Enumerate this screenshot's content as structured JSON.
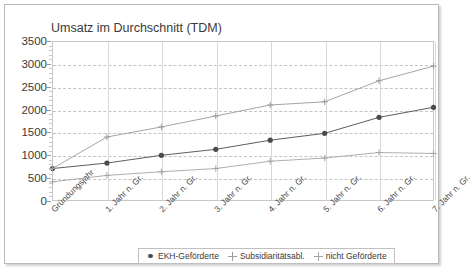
{
  "chart_data": {
    "type": "line",
    "title": "Umsatz im Durchschnitt (TDM)",
    "xlabel": "",
    "ylabel": "",
    "ylim": [
      0,
      3500
    ],
    "ytick_step": 500,
    "yticks": [
      "0",
      "500",
      "1000",
      "1500",
      "2000",
      "2500",
      "3000",
      "3500"
    ],
    "grid": true,
    "legend_position": "bottom",
    "categories": [
      "Gründungsjahr",
      "1. Jahr n. Gr.",
      "2. Jahr n. Gr.",
      "3. Jahr n. Gr.",
      "4. Jahr n. Gr.",
      "5. Jahr n. Gr.",
      "6. Jahr n. Gr.",
      "7. Jahr n. Gr."
    ],
    "series": [
      {
        "name": "EKH-Geförderte",
        "marker": "filled-circle",
        "color": "#4b4b4b",
        "values": [
          710,
          830,
          1000,
          1130,
          1330,
          1480,
          1830,
          2050
        ]
      },
      {
        "name": "Subsidiaritätsabl.",
        "marker": "plus",
        "color": "#9b9b9b",
        "values": [
          710,
          1400,
          1620,
          1860,
          2100,
          2170,
          2630,
          2950
        ]
      },
      {
        "name": "nicht Geförderte",
        "marker": "star",
        "color": "#a5a5a5",
        "values": [
          420,
          560,
          640,
          710,
          870,
          940,
          1060,
          1040
        ]
      }
    ]
  }
}
